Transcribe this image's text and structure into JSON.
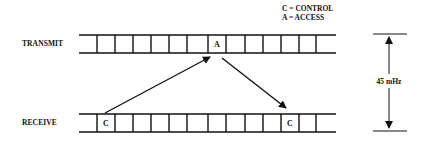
{
  "legend": {
    "line1": "C = CONTROL",
    "line2": "A = ACCESS"
  },
  "channels": [
    {
      "label": "TRANSMIT",
      "marked_cell": {
        "index": 7,
        "letter": "A"
      }
    },
    {
      "label": "RECEIVE",
      "marked_cell": {
        "index": 1,
        "letter": "C"
      },
      "second_marked_cell": {
        "index": 11,
        "letter": "C"
      }
    }
  ],
  "dimension": {
    "label": "45 mHz"
  },
  "colors": {
    "line": "#111111",
    "background": "#ffffff"
  }
}
